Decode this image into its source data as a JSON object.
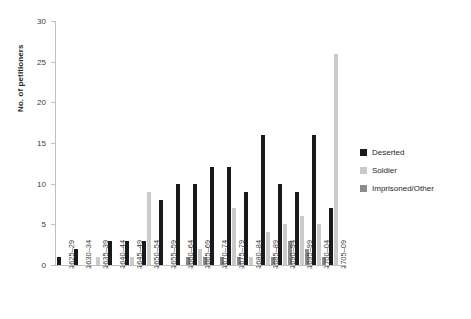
{
  "chart_data": {
    "type": "bar",
    "title": "",
    "xlabel": "",
    "ylabel": "No. of petitioners",
    "ylim": [
      0,
      30
    ],
    "yticks": [
      0,
      5,
      10,
      15,
      20,
      25,
      30
    ],
    "grid": false,
    "legend_position": "right",
    "categories": [
      "1625–29",
      "1630–34",
      "1635–39",
      "1640–44",
      "1645–49",
      "1650–54",
      "1655–59",
      "1660–64",
      "1665–69",
      "1670–74",
      "1675–79",
      "1680–84",
      "1685–89",
      "1690–94",
      "1695–99",
      "1700–04",
      "1705–09"
    ],
    "series": [
      {
        "name": "Deserted",
        "color": "#1a1a1a",
        "values": [
          1,
          2,
          0,
          3,
          3,
          3,
          8,
          10,
          10,
          12,
          12,
          9,
          16,
          10,
          9,
          16,
          7
        ]
      },
      {
        "name": "Soldier",
        "color": "#cacaca",
        "values": [
          0,
          0,
          1,
          0,
          1,
          9,
          0,
          0,
          2,
          0,
          7,
          1,
          4,
          5,
          6,
          5,
          26
        ]
      },
      {
        "name": "Imprisoned/Other",
        "color": "#8c8c8c",
        "values": [
          0,
          0,
          0,
          0,
          0,
          0,
          0,
          1,
          1,
          1,
          1,
          0,
          1,
          3,
          2,
          1,
          0
        ]
      }
    ]
  },
  "legend": {
    "items": [
      {
        "label": "Deserted",
        "color": "#1a1a1a"
      },
      {
        "label": "Soldier",
        "color": "#cacaca"
      },
      {
        "label": "Imprisoned/Other",
        "color": "#8c8c8c"
      }
    ]
  }
}
